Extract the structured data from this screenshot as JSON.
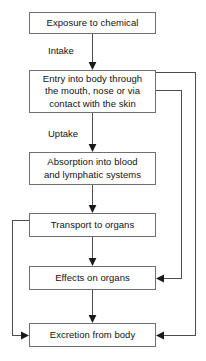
{
  "diagram": {
    "type": "flowchart",
    "orientation": "top-to-bottom",
    "colors": {
      "background": "#ffffff",
      "box_border": "#6f6f6f",
      "connector": "#4d4d4d",
      "arrowhead": "#1a1a1a",
      "text": "#121212"
    },
    "nodes": [
      {
        "id": "exposure",
        "label": "Exposure to chemical"
      },
      {
        "id": "entry",
        "label": "Entry into body through\nthe mouth, nose or via\ncontact with the skin"
      },
      {
        "id": "absorption",
        "label": "Absorption into blood\nand lymphatic systems"
      },
      {
        "id": "transport",
        "label": "Transport to organs"
      },
      {
        "id": "effects",
        "label": "Effects on organs"
      },
      {
        "id": "excretion",
        "label": "Excretion from body"
      }
    ],
    "edge_labels": [
      {
        "id": "intake",
        "label": "Intake",
        "between": "exposure-to-entry"
      },
      {
        "id": "uptake",
        "label": "Uptake",
        "between": "entry-to-absorption"
      }
    ],
    "edges": [
      {
        "from": "exposure",
        "to": "entry",
        "label": "Intake",
        "route": "straight-down"
      },
      {
        "from": "entry",
        "to": "absorption",
        "label": "Uptake",
        "route": "straight-down"
      },
      {
        "from": "absorption",
        "to": "transport",
        "label": "",
        "route": "straight-down"
      },
      {
        "from": "transport",
        "to": "effects",
        "label": "",
        "route": "straight-down"
      },
      {
        "from": "effects",
        "to": "excretion",
        "label": "",
        "route": "straight-down"
      },
      {
        "from": "entry",
        "to": "effects",
        "label": "",
        "route": "right-side-feedback-inner"
      },
      {
        "from": "entry",
        "to": "excretion",
        "label": "",
        "route": "right-side-feedback-outer"
      },
      {
        "from": "transport",
        "to": "excretion",
        "label": "",
        "route": "left-side-feedback"
      }
    ]
  }
}
